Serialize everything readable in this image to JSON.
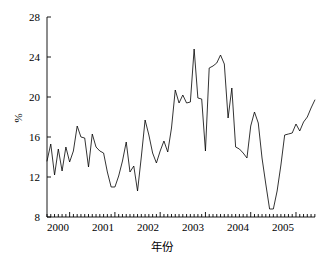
{
  "chart_data": {
    "type": "line",
    "title": "",
    "xlabel": "年份",
    "ylabel": "%",
    "ylim": [
      8,
      28
    ],
    "yticks": [
      8,
      12,
      16,
      20,
      24,
      28
    ],
    "ytick_labels": [
      "8",
      "12",
      "16",
      "20",
      "24",
      "28"
    ],
    "xlim": [
      1999.5,
      2005.42
    ],
    "xticks": [
      2000,
      2001,
      2002,
      2003,
      2004,
      2005
    ],
    "xtick_labels": [
      "2000",
      "2001",
      "2002",
      "2003",
      "2004",
      "2005"
    ],
    "grid": false,
    "legend": null,
    "minor_ticks": "monthly",
    "line_color": "#000000",
    "line_width": 0.8,
    "background": "#ffffff",
    "series": [
      {
        "name": "月度百分比",
        "x": [
          1999.5,
          1999.583,
          1999.667,
          1999.75,
          1999.833,
          1999.917,
          2000.0,
          2000.083,
          2000.167,
          2000.25,
          2000.333,
          2000.417,
          2000.5,
          2000.583,
          2000.667,
          2000.75,
          2000.833,
          2000.917,
          2001.0,
          2001.083,
          2001.167,
          2001.25,
          2001.333,
          2001.417,
          2001.5,
          2001.583,
          2001.667,
          2001.75,
          2001.833,
          2001.917,
          2002.0,
          2002.083,
          2002.167,
          2002.25,
          2002.333,
          2002.417,
          2002.5,
          2002.583,
          2002.667,
          2002.75,
          2002.833,
          2002.917,
          2003.0,
          2003.083,
          2003.167,
          2003.25,
          2003.333,
          2003.417,
          2003.5,
          2003.583,
          2003.667,
          2003.75,
          2003.833,
          2003.917,
          2004.0,
          2004.083,
          2004.167,
          2004.25,
          2004.333,
          2004.417,
          2004.5,
          2004.583,
          2004.667,
          2004.75,
          2004.833,
          2004.917,
          2005.0,
          2005.083,
          2005.167,
          2005.25,
          2005.333,
          2005.417
        ],
        "values": [
          13.6,
          15.3,
          12.2,
          14.8,
          12.6,
          15.0,
          13.5,
          14.6,
          17.1,
          16.0,
          15.9,
          13.0,
          16.3,
          15.0,
          14.6,
          14.4,
          12.5,
          11.0,
          11.0,
          12.1,
          13.6,
          15.5,
          12.5,
          13.1,
          10.6,
          14.0,
          17.7,
          16.2,
          14.4,
          13.4,
          14.6,
          15.6,
          14.5,
          16.9,
          20.7,
          19.4,
          20.2,
          19.4,
          19.5,
          24.8,
          19.9,
          19.8,
          14.6,
          22.9,
          23.1,
          23.4,
          24.2,
          23.3,
          17.9,
          20.9,
          15.0,
          14.8,
          14.4,
          13.9,
          17.1,
          18.5,
          17.4,
          13.9,
          11.3,
          8.8,
          8.8,
          10.6,
          13.2,
          16.2,
          16.3,
          16.4,
          17.3,
          16.6,
          17.5,
          18.0,
          18.9,
          19.7
        ]
      }
    ]
  },
  "axes": {
    "ytick_labels": [
      "28",
      "24",
      "20",
      "16",
      "12",
      "8"
    ],
    "xtick_labels": [
      "2000",
      "2001",
      "2002",
      "2003",
      "2004",
      "2005"
    ],
    "ylabel": "%",
    "xlabel": "年份"
  }
}
